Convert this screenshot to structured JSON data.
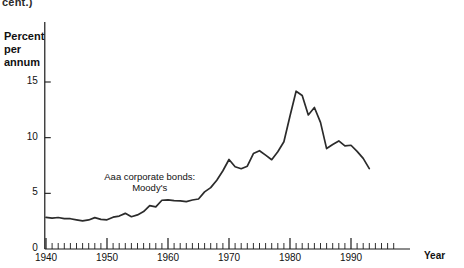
{
  "figure": {
    "clipped_header": "cent.)",
    "y_axis_title": "Percent\nper\nannum",
    "x_axis_title": "Year"
  },
  "chart_data": {
    "type": "line",
    "title": "",
    "subtitle": "",
    "xlabel": "Year",
    "ylabel": "Percent per annum",
    "xlim": [
      1939,
      1994
    ],
    "ylim": [
      0,
      16.5
    ],
    "grid": false,
    "legend_position": "inline-annotation",
    "y_ticks": [
      0,
      5,
      10,
      15
    ],
    "y_tick_labels": [
      "0",
      "5",
      "10",
      "15"
    ],
    "x_ticks": [
      1940,
      1950,
      1960,
      1970,
      1980,
      1990
    ],
    "x_tick_labels": [
      "1940",
      "1950",
      "1960",
      "1970",
      "1980",
      "1990"
    ],
    "x_minor_tick_interval": 1,
    "annotations": [
      {
        "text": "Aaa corporate bonds:\nMoody's",
        "x": 1957,
        "y": 6.3
      }
    ],
    "series": [
      {
        "name": "Aaa corporate bonds: Moody's",
        "color": "#2b2b2b",
        "x": [
          1940,
          1941,
          1942,
          1943,
          1944,
          1945,
          1946,
          1947,
          1948,
          1949,
          1950,
          1951,
          1952,
          1953,
          1954,
          1955,
          1956,
          1957,
          1958,
          1959,
          1960,
          1961,
          1962,
          1963,
          1964,
          1965,
          1966,
          1967,
          1968,
          1969,
          1970,
          1971,
          1972,
          1973,
          1974,
          1975,
          1976,
          1977,
          1978,
          1979,
          1980,
          1981,
          1982,
          1983,
          1984,
          1985,
          1986,
          1987,
          1988,
          1989,
          1990,
          1991,
          1992,
          1993
        ],
        "values": [
          2.84,
          2.77,
          2.83,
          2.73,
          2.72,
          2.62,
          2.53,
          2.61,
          2.82,
          2.66,
          2.62,
          2.86,
          2.96,
          3.2,
          2.9,
          3.06,
          3.36,
          3.89,
          3.79,
          4.38,
          4.41,
          4.35,
          4.33,
          4.26,
          4.4,
          4.49,
          5.13,
          5.51,
          6.18,
          7.03,
          8.04,
          7.39,
          7.21,
          7.44,
          8.57,
          8.83,
          8.43,
          8.02,
          8.73,
          9.63,
          11.94,
          14.17,
          13.79,
          12.04,
          12.71,
          11.37,
          9.02,
          9.38,
          9.71,
          9.26,
          9.32,
          8.77,
          8.14,
          7.22
        ]
      }
    ]
  }
}
